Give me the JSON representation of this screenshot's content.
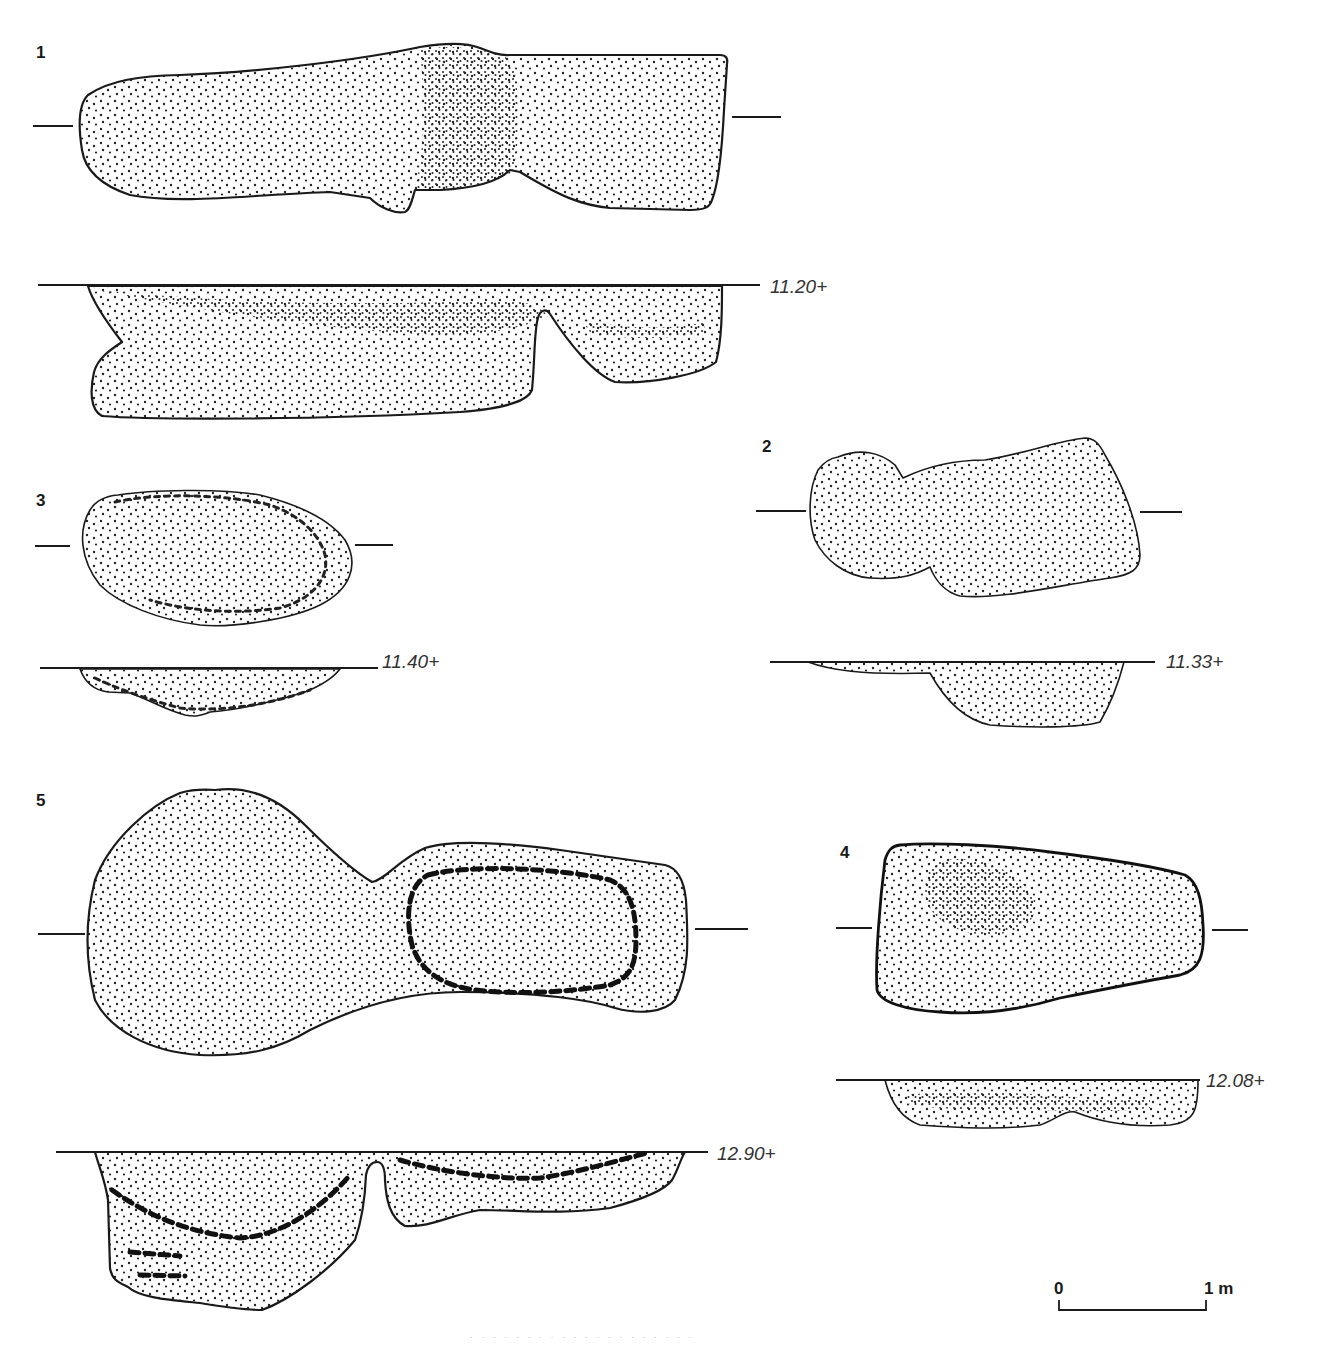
{
  "figure": {
    "type": "archaeological pit plans and sections",
    "features": [
      {
        "id": "1",
        "label": "1",
        "section_level": "11.20+"
      },
      {
        "id": "2",
        "label": "2",
        "section_level": "11.33+"
      },
      {
        "id": "3",
        "label": "3",
        "section_level": "11.40+"
      },
      {
        "id": "4",
        "label": "4",
        "section_level": "12.08+"
      },
      {
        "id": "5",
        "label": "5",
        "section_level": "12.90+"
      }
    ],
    "scale_bar": {
      "start_label": "0",
      "end_label": "1 m"
    },
    "footer_text": "· · · · · · · · · · · · · · · · · · · ·",
    "colors": {
      "ink": "#1a1a1a",
      "background": "#ffffff",
      "level_text": "#333333"
    }
  }
}
